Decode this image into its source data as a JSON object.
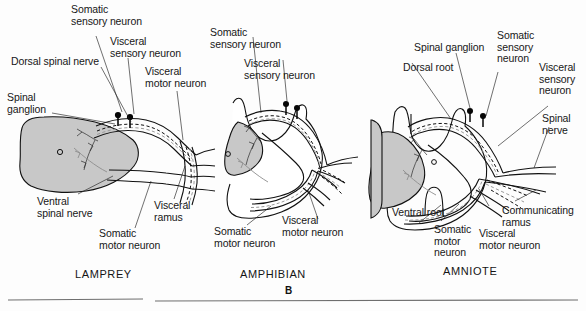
{
  "figure": {
    "kind": "comparative-anatomy-diagram",
    "panel_letter": "B",
    "description_text": "Cross sections of spinal cord and spinal nerves in lamprey, amphibian and amniote",
    "ink_color": "#111111",
    "gray_matter_color": "#c8c8c8",
    "paper_color": "#fdfdfd"
  },
  "panels": [
    {
      "id": "lamprey",
      "title": "LAMPREY",
      "labels": [
        {
          "name": "somatic-sensory-neuron",
          "text": "Somatic\nsensory neuron"
        },
        {
          "name": "visceral-sensory-neuron",
          "text": "Visceral\nsensory neuron"
        },
        {
          "name": "visceral-motor-neuron",
          "text": "Visceral\nmotor neuron"
        },
        {
          "name": "dorsal-spinal-nerve",
          "text": "Dorsal spinal nerve"
        },
        {
          "name": "spinal-ganglion",
          "text": "Spinal\nganglion"
        },
        {
          "name": "ventral-spinal-nerve",
          "text": "Ventral\nspinal nerve"
        },
        {
          "name": "somatic-motor-neuron",
          "text": "Somatic\nmotor neuron"
        },
        {
          "name": "visceral-ramus",
          "text": "Visceral\nramus"
        }
      ]
    },
    {
      "id": "amphibian",
      "title": "AMPHIBIAN",
      "labels": [
        {
          "name": "somatic-sensory-neuron",
          "text": "Somatic\nsensory neuron"
        },
        {
          "name": "visceral-sensory-neuron",
          "text": "Visceral\nsensory neuron"
        },
        {
          "name": "somatic-motor-neuron",
          "text": "Somatic\nmotor neuron"
        },
        {
          "name": "visceral-motor-neuron",
          "text": "Visceral\nmotor neuron"
        }
      ]
    },
    {
      "id": "amniote",
      "title": "AMNIOTE",
      "labels": [
        {
          "name": "spinal-ganglion",
          "text": "Spinal ganglion"
        },
        {
          "name": "dorsal-root",
          "text": "Dorsal root"
        },
        {
          "name": "somatic-sensory-neuron",
          "text": "Somatic\nsensory\nneuron"
        },
        {
          "name": "visceral-sensory-neuron",
          "text": "Visceral\nsensory\nneuron"
        },
        {
          "name": "spinal-nerve",
          "text": "Spinal\nnerve"
        },
        {
          "name": "ventral-root",
          "text": "Ventral root"
        },
        {
          "name": "somatic-motor-neuron",
          "text": "Somatic\nmotor\nneuron"
        },
        {
          "name": "visceral-motor-neuron",
          "text": "Visceral\nmotor neuron"
        },
        {
          "name": "communicating-ramus",
          "text": "Communicating\nramus"
        }
      ]
    }
  ],
  "text": {
    "lamprey": {
      "somatic_sensory_l1": "Somatic",
      "somatic_sensory_l2": "sensory neuron",
      "visceral_sensory_l1": "Visceral",
      "visceral_sensory_l2": "sensory neuron",
      "visceral_motor_l1": "Visceral",
      "visceral_motor_l2": "motor neuron",
      "dorsal_spinal_nerve": "Dorsal spinal nerve",
      "spinal_ganglion_l1": "Spinal",
      "spinal_ganglion_l2": "ganglion",
      "ventral_spinal_nerve_l1": "Ventral",
      "ventral_spinal_nerve_l2": "spinal nerve",
      "somatic_motor_l1": "Somatic",
      "somatic_motor_l2": "motor neuron",
      "visceral_ramus_l1": "Visceral",
      "visceral_ramus_l2": "ramus",
      "title": "LAMPREY"
    },
    "amphibian": {
      "somatic_sensory_l1": "Somatic",
      "somatic_sensory_l2": "sensory neuron",
      "visceral_sensory_l1": "Visceral",
      "visceral_sensory_l2": "sensory neuron",
      "somatic_motor_l1": "Somatic",
      "somatic_motor_l2": "motor neuron",
      "visceral_motor_l1": "Visceral",
      "visceral_motor_l2": "motor neuron",
      "title": "AMPHIBIAN"
    },
    "amniote": {
      "spinal_ganglion": "Spinal ganglion",
      "dorsal_root": "Dorsal root",
      "somatic_sensory_l1": "Somatic",
      "somatic_sensory_l2": "sensory",
      "somatic_sensory_l3": "neuron",
      "visceral_sensory_l1": "Visceral",
      "visceral_sensory_l2": "sensory",
      "visceral_sensory_l3": "neuron",
      "spinal_nerve_l1": "Spinal",
      "spinal_nerve_l2": "nerve",
      "ventral_root": "Ventral root",
      "somatic_motor_l1": "Somatic",
      "somatic_motor_l2": "motor",
      "somatic_motor_l3": "neuron",
      "visceral_motor_l1": "Visceral",
      "visceral_motor_l2": "motor neuron",
      "communicating_ramus_l1": "Communicating",
      "communicating_ramus_l2": "ramus",
      "title": "AMNIOTE"
    },
    "panel_letter": "B"
  }
}
